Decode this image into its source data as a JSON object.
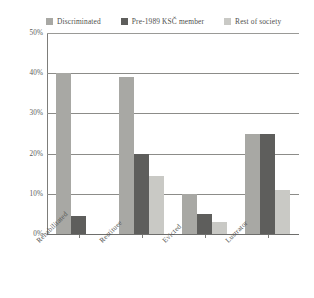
{
  "legend": {
    "entries": [
      {
        "label": "Discriminated",
        "color": "#a8a8a4",
        "swatch_name": "legend-swatch-discriminated"
      },
      {
        "label": "Pre-1989 KSČ member",
        "color": "#5e5e5c",
        "swatch_name": "legend-swatch-ksc-member"
      },
      {
        "label": "Rest of society",
        "color": "#c9c9c5",
        "swatch_name": "legend-swatch-rest-of-society"
      }
    ]
  },
  "axis": {
    "y_ticks": [
      "0%",
      "10%",
      "20%",
      "30%",
      "40%",
      "50%"
    ],
    "x_labels": [
      "Rehabilitated",
      "Restituee",
      "Evicted",
      "Lustrator"
    ]
  },
  "chart_data": {
    "type": "bar",
    "title": "",
    "subtitle": "",
    "xlabel": "",
    "ylabel": "",
    "ylim": [
      0,
      50
    ],
    "ytick_values": [
      0,
      10,
      20,
      30,
      40,
      50
    ],
    "ytick_labels": [
      "0%",
      "10%",
      "20%",
      "30%",
      "40%",
      "50%"
    ],
    "grid": true,
    "grid_axis": "y",
    "legend_position": "top",
    "categories": [
      "Rehabilitated",
      "Restituee",
      "Evicted",
      "Lustrator"
    ],
    "series": [
      {
        "name": "Discriminated",
        "color": "#a8a8a4",
        "values": [
          40,
          39,
          10,
          25
        ]
      },
      {
        "name": "Pre-1989 KSČ member",
        "color": "#5e5e5c",
        "values": [
          4.5,
          20,
          5,
          25
        ]
      },
      {
        "name": "Rest of society",
        "color": "#c9c9c5",
        "values": [
          0,
          14.5,
          3,
          11
        ]
      }
    ]
  }
}
